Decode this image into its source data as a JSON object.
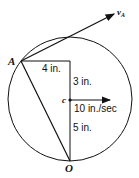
{
  "diagram": {
    "points": {
      "A": "A",
      "O": "O",
      "c": "c"
    },
    "velocity_label": "v",
    "velocity_sub": "A",
    "dimensions": {
      "horizontal": "4 in.",
      "vertical_top": "3 in.",
      "vertical_bottom": "5 in."
    },
    "center_velocity": "10 in./sec",
    "colors": {
      "stroke": "#111111",
      "background": "#ffffff"
    }
  }
}
